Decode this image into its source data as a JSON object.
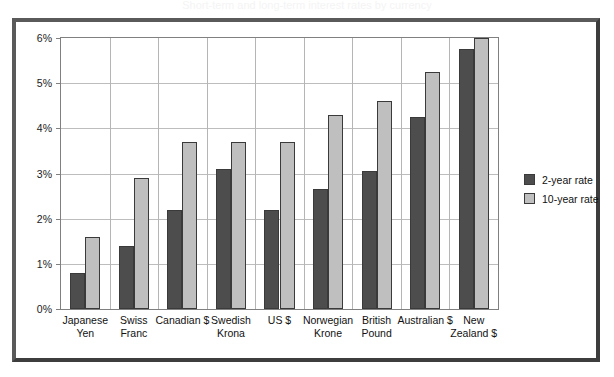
{
  "chart_data": {
    "type": "bar",
    "title": "Short-term and long-term interest rates by currency",
    "xlabel": "",
    "ylabel": "",
    "ylim": [
      0,
      6
    ],
    "ytick_labels": [
      "0%",
      "1%",
      "2%",
      "3%",
      "4%",
      "5%",
      "6%"
    ],
    "ytick_values": [
      0,
      1,
      2,
      3,
      4,
      5,
      6
    ],
    "grid": true,
    "legend_position": "right",
    "categories": [
      "Japanese Yen",
      "Swiss Franc",
      "Canadian $",
      "Swedish Krona",
      "US $",
      "Norwegian Krone",
      "British Pound",
      "Australian $",
      "New Zealand $"
    ],
    "category_lines": [
      [
        "Japanese",
        "Yen"
      ],
      [
        "Swiss",
        "Franc"
      ],
      [
        "Canadian $"
      ],
      [
        "Swedish",
        "Krona"
      ],
      [
        "US $"
      ],
      [
        "Norwegian",
        "Krone"
      ],
      [
        "British",
        "Pound"
      ],
      [
        "Australian $"
      ],
      [
        "New",
        "Zealand $"
      ]
    ],
    "series": [
      {
        "name": "2-year rate",
        "color": "#4d4d4d",
        "values": [
          0.8,
          1.4,
          2.2,
          3.1,
          2.2,
          2.65,
          3.05,
          4.25,
          5.75
        ]
      },
      {
        "name": "10-year rate",
        "color": "#bfbfbf",
        "values": [
          1.6,
          2.9,
          3.7,
          3.7,
          3.7,
          4.3,
          4.6,
          5.25,
          6.0
        ]
      }
    ]
  }
}
